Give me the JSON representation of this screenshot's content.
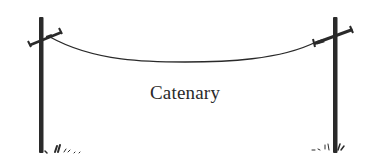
{
  "figure": {
    "label": "Catenary",
    "colors": {
      "ink": "#2a2a2a",
      "background": "#ffffff"
    },
    "elements": [
      {
        "name": "left-utility-pole",
        "type": "pole"
      },
      {
        "name": "right-utility-pole",
        "type": "pole"
      },
      {
        "name": "hanging-cable",
        "type": "catenary-curve"
      },
      {
        "name": "grass-tufts",
        "type": "decoration"
      }
    ]
  }
}
